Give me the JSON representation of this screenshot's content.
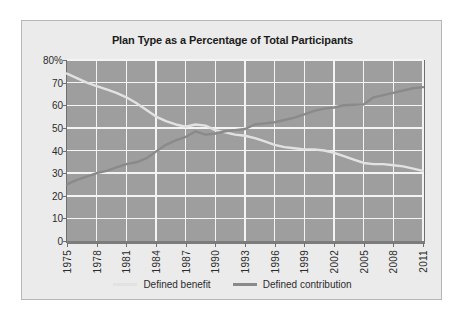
{
  "figure": {
    "background": "#ffffff",
    "panel_background": "#ebebeb",
    "plot_background": "#9e9e9e",
    "grid_color": "#f4f4f4"
  },
  "chart_data": {
    "type": "line",
    "title": "Plan Type as a Percentage of Total Participants",
    "xlabel": "",
    "ylabel": "",
    "ylim": [
      0,
      80
    ],
    "xlim": [
      1975,
      2011
    ],
    "grid": true,
    "legend_position": "bottom",
    "ytick_labels": [
      "80%",
      "70",
      "60",
      "50",
      "40",
      "30",
      "20",
      "10",
      "0"
    ],
    "ytick_values": [
      80,
      70,
      60,
      50,
      40,
      30,
      20,
      10,
      0
    ],
    "xtick_labels": [
      "1975",
      "1978",
      "1981",
      "1984",
      "1987",
      "1990",
      "1993",
      "1996",
      "1999",
      "2002",
      "2005",
      "2008",
      "2011"
    ],
    "xtick_values": [
      1975,
      1978,
      1981,
      1984,
      1987,
      1990,
      1993,
      1996,
      1999,
      2002,
      2005,
      2008,
      2011
    ],
    "x": [
      1975,
      1976,
      1977,
      1978,
      1979,
      1980,
      1981,
      1982,
      1983,
      1984,
      1985,
      1986,
      1987,
      1988,
      1989,
      1990,
      1991,
      1992,
      1993,
      1994,
      1995,
      1996,
      1997,
      1998,
      1999,
      2000,
      2001,
      2002,
      2003,
      2004,
      2005,
      2006,
      2007,
      2008,
      2009,
      2010,
      2011
    ],
    "series": [
      {
        "name": "Defined benefit",
        "color": "#e2e2e2",
        "values": [
          74.0,
          72.0,
          70.0,
          68.5,
          67.0,
          65.5,
          63.5,
          61.0,
          58.0,
          55.0,
          53.0,
          51.5,
          50.5,
          51.5,
          51.0,
          49.0,
          48.0,
          47.0,
          46.5,
          45.5,
          44.0,
          42.5,
          41.5,
          41.0,
          40.5,
          40.5,
          40.0,
          39.0,
          37.5,
          36.0,
          34.5,
          34.0,
          34.0,
          33.5,
          33.0,
          32.0,
          31.0
        ]
      },
      {
        "name": "Defined contribution",
        "color": "#8a8a8a",
        "values": [
          25.0,
          27.0,
          28.5,
          30.0,
          31.0,
          32.5,
          34.0,
          34.8,
          36.5,
          39.5,
          42.5,
          44.5,
          46.0,
          48.5,
          47.0,
          47.5,
          48.5,
          49.0,
          49.5,
          51.5,
          52.0,
          52.5,
          53.5,
          54.5,
          56.0,
          57.5,
          58.5,
          59.0,
          60.0,
          60.2,
          60.3,
          63.5,
          64.5,
          65.5,
          66.5,
          67.5,
          68.0
        ]
      }
    ],
    "legend": [
      {
        "label": "Defined benefit",
        "color": "#e2e2e2"
      },
      {
        "label": "Defined contribution",
        "color": "#8a8a8a"
      }
    ]
  }
}
